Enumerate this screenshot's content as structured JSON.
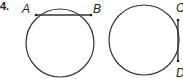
{
  "problem": {
    "number": "4.",
    "figures": [
      {
        "name": "circle-with-chord-AB",
        "chord": {
          "start": "A",
          "end": "B",
          "orientation": "horizontal"
        }
      },
      {
        "name": "circle-with-chord-CD",
        "chord": {
          "start": "C",
          "end": "D",
          "orientation": "vertical"
        }
      }
    ]
  },
  "colors": {
    "stroke": "#333333",
    "text": "#222222"
  }
}
